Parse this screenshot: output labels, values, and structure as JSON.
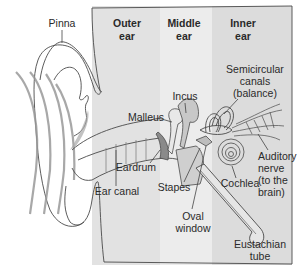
{
  "diagram": {
    "sections": [
      {
        "name": "outer",
        "line1": "Outer",
        "line2": "ear",
        "color": "#e2e2e2"
      },
      {
        "name": "middle",
        "line1": "Middle",
        "line2": "ear",
        "color": "#ececec"
      },
      {
        "name": "inner",
        "line1": "Inner",
        "line2": "ear",
        "color": "#dcdcdc"
      }
    ],
    "labels": {
      "pinna": "Pinna",
      "malleus": "Malleus",
      "incus": "Incus",
      "semicircular": [
        "Semicircular",
        "canals",
        "(balance)"
      ],
      "auditory_nerve": [
        "Auditory",
        "nerve",
        "(to the",
        "brain)"
      ],
      "eardrum": "Eardrum",
      "ear_canal": "Ear canal",
      "stapes": "Stapes",
      "cochlea": "Cochlea",
      "oval_window": [
        "Oval",
        "window"
      ],
      "eustachian_tube": [
        "Eustachian",
        "tube"
      ]
    },
    "colors": {
      "ear_fill": "#d8d8d8",
      "sound_wave": "#9a9a9a",
      "bone_fill": "#c8c8c8",
      "line": "#4a4a4a"
    }
  }
}
